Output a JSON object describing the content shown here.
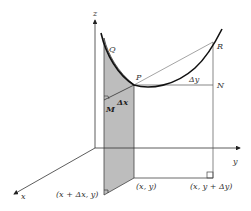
{
  "diagram": {
    "type": "3d-surface-partial-derivative-figure",
    "axes": {
      "x_label": "x",
      "y_label": "y",
      "z_label": "z"
    },
    "points": {
      "P": "P",
      "Q": "Q",
      "R": "R",
      "N": "N",
      "M": "M"
    },
    "increments": {
      "dx": "Δx",
      "dy": "Δy"
    },
    "base_points": {
      "x_plus_dx": "(x + Δx, y)",
      "origin_xy": "(x, y)",
      "y_plus_dy": "(x, y + Δy)"
    },
    "colors": {
      "line": "#222222",
      "thin_line": "#555555",
      "shade": "#b8b8b8",
      "background": "#ffffff"
    }
  }
}
